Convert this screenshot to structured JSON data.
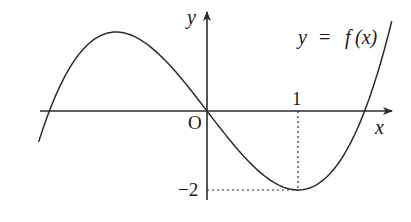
{
  "chart_data": {
    "type": "line",
    "title": "",
    "function_label": "y = f(x)",
    "function_label_parts": {
      "y": "y",
      "eq": "=",
      "f": "f",
      "args": "(x)"
    },
    "xlabel": "x",
    "ylabel": "y",
    "origin_label": "O",
    "x_tick_labels": [
      "1"
    ],
    "y_tick_labels": [
      "−2"
    ],
    "annotations": [
      {
        "type": "dotted_guide",
        "point": [
          1,
          -2
        ],
        "description": "dotted lines from local minimum (1, −2) to both axes"
      }
    ],
    "key_points": [
      {
        "x": -1,
        "y": 2,
        "kind": "local maximum"
      },
      {
        "x": 0,
        "y": 0,
        "kind": "passes through origin"
      },
      {
        "x": 1,
        "y": -2,
        "kind": "local minimum"
      }
    ],
    "curve_shape": "cubic, rising-falling-rising (e.g. x^3 - 3x)",
    "x_range": [
      -1.85,
      2.03
    ],
    "y_range": [
      -2.2,
      2.3
    ],
    "grid": false,
    "legend": "none"
  },
  "labels": {
    "y_axis": "y",
    "x_axis": "x",
    "origin": "O",
    "x_tick": "1",
    "y_tick": "−2",
    "func_y": "y",
    "func_eq": "=",
    "func_f": "f",
    "func_args": "(x)"
  },
  "colors": {
    "stroke": "#2b2b2b",
    "text": "#1a1a1a",
    "background": "#ffffff"
  }
}
